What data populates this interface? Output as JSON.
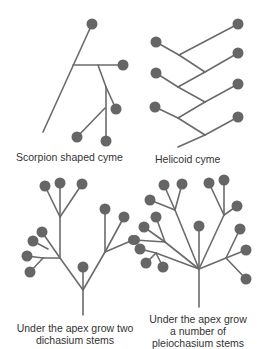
{
  "captions": {
    "scorpion": "Scorpion shaped cyme",
    "helicoid": "Helicoid cyme",
    "dichasium_line1": "Under the apex grow two",
    "dichasium_line2": "dichasium stems",
    "pleiochasium_line1": "Under the apex grow",
    "pleiochasium_line2": "a number of",
    "pleiochasium_line3": "pleiochasium stems"
  },
  "colors": {
    "stem": "#6b6b6b",
    "flower": "#666666",
    "text": "#333333",
    "background": "#ffffff"
  }
}
